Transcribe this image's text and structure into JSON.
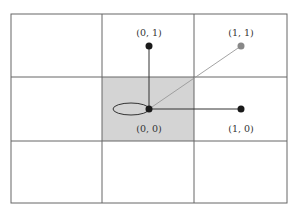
{
  "diagram": {
    "grid": {
      "rows": 3,
      "cols": 3,
      "highlighted_cell": {
        "row": 1,
        "col": 1
      }
    },
    "colors": {
      "grid_line": "#555555",
      "highlight_fill": "#d4d4d4",
      "node_dark": "#1a1a1a",
      "node_light": "#888888",
      "edge_dark": "#333333",
      "edge_light": "#999999",
      "label": "#333333"
    },
    "nodes": [
      {
        "id": "n00",
        "label": "(0, 0)",
        "label_position": "below",
        "tone": "dark",
        "self_loop": true
      },
      {
        "id": "n01",
        "label": "(0, 1)",
        "label_position": "above",
        "tone": "dark",
        "self_loop": false
      },
      {
        "id": "n11",
        "label": "(1, 1)",
        "label_position": "above",
        "tone": "light",
        "self_loop": false
      },
      {
        "id": "n10",
        "label": "(1, 0)",
        "label_position": "below",
        "tone": "dark",
        "self_loop": false
      }
    ],
    "edges": [
      {
        "from": "n00",
        "to": "n01",
        "tone": "dark"
      },
      {
        "from": "n00",
        "to": "n11",
        "tone": "light"
      },
      {
        "from": "n00",
        "to": "n10",
        "tone": "dark"
      }
    ]
  }
}
